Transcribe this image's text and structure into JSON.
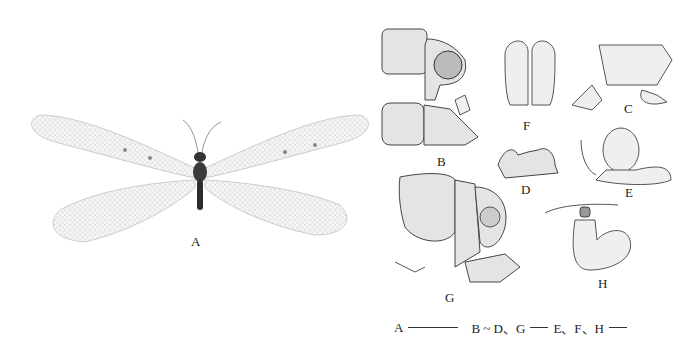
{
  "figure": {
    "panels": [
      {
        "id": "A",
        "label": "A",
        "subject": "adult lacewing, dorsal habitus"
      },
      {
        "id": "B",
        "label": "B",
        "subject": "male terminalia, lateral view"
      },
      {
        "id": "C",
        "label": "C",
        "subject": "genital structure"
      },
      {
        "id": "D",
        "label": "D",
        "subject": "genital sclerite"
      },
      {
        "id": "E",
        "label": "E",
        "subject": "genital structure"
      },
      {
        "id": "F",
        "label": "F",
        "subject": "genital structure, ventral view"
      },
      {
        "id": "G",
        "label": "G",
        "subject": "female terminalia, lateral view"
      },
      {
        "id": "H",
        "label": "H",
        "subject": "spermatheca"
      }
    ],
    "scale_bars": [
      {
        "label": "A",
        "width_px": 50
      },
      {
        "label": "B ~ D、G",
        "width_px": 18
      },
      {
        "label": "E、F、H",
        "width_px": 18
      }
    ]
  }
}
